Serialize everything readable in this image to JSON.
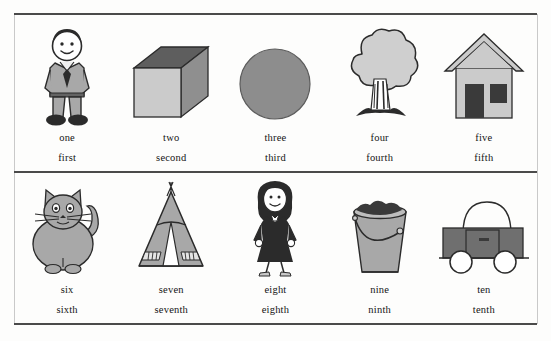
{
  "sheet": {
    "title": "Cardinal and ordinal numbers picture chart",
    "background_color": "#fdfdfc",
    "rule_color": "#4a4a4a",
    "frame_color": "#c9c9c9"
  },
  "palette": {
    "ink": "#141414",
    "outline": "#2b2b2b",
    "light_gray": "#cfcfcf",
    "mid_gray": "#9a9a9a",
    "dark_gray": "#6f6f6f",
    "near_black": "#3a3a3a",
    "paper": "#ffffff"
  },
  "rows": [
    {
      "name": "row-one-to-five",
      "cells": [
        {
          "icon": "boy-icon",
          "cardinal": "one",
          "ordinal": "first"
        },
        {
          "icon": "box-icon",
          "cardinal": "two",
          "ordinal": "second"
        },
        {
          "icon": "circle-icon",
          "cardinal": "three",
          "ordinal": "third"
        },
        {
          "icon": "tree-icon",
          "cardinal": "four",
          "ordinal": "fourth"
        },
        {
          "icon": "house-icon",
          "cardinal": "five",
          "ordinal": "fifth"
        }
      ]
    },
    {
      "name": "row-six-to-ten",
      "cells": [
        {
          "icon": "cat-icon",
          "cardinal": "six",
          "ordinal": "sixth"
        },
        {
          "icon": "teepee-icon",
          "cardinal": "seven",
          "ordinal": "seventh"
        },
        {
          "icon": "woman-icon",
          "cardinal": "eight",
          "ordinal": "eighth"
        },
        {
          "icon": "bucket-icon",
          "cardinal": "nine",
          "ordinal": "ninth"
        },
        {
          "icon": "car-icon",
          "cardinal": "ten",
          "ordinal": "tenth"
        }
      ]
    }
  ]
}
